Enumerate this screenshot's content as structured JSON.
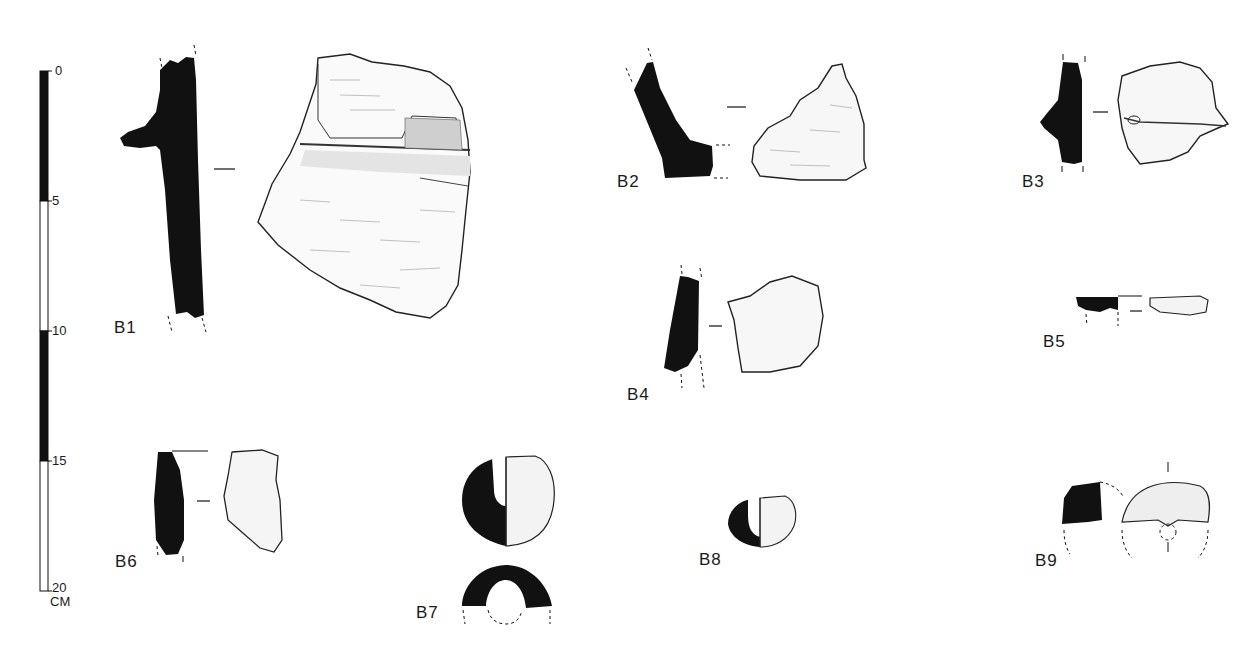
{
  "figure": {
    "type": "archaeological pottery sherd drawings",
    "background": "#ffffff",
    "ink_color": "#111111"
  },
  "scale_bar": {
    "ticks": [
      "0",
      "5",
      "10",
      "15",
      "20"
    ],
    "unit": "CM",
    "segments": [
      {
        "from": 0,
        "to": 5,
        "fill": "black"
      },
      {
        "from": 5,
        "to": 10,
        "fill": "white"
      },
      {
        "from": 10,
        "to": 15,
        "fill": "black"
      },
      {
        "from": 15,
        "to": 20,
        "fill": "white"
      }
    ]
  },
  "sherds": [
    {
      "id": "B1",
      "label": "B1",
      "description": "Rim sherd profile with applied ridge and exterior view"
    },
    {
      "id": "B2",
      "label": "B2",
      "description": "Angled rim profile with lumpy exterior view"
    },
    {
      "id": "B3",
      "label": "B3",
      "description": "Body sherd with ridge profile and exterior view"
    },
    {
      "id": "B4",
      "label": "B4",
      "description": "Body sherd profile and exterior view"
    },
    {
      "id": "B5",
      "label": "B5",
      "description": "Small flat rim profile and view"
    },
    {
      "id": "B6",
      "label": "B6",
      "description": "Rim sherd profile and exterior view"
    },
    {
      "id": "B7",
      "label": "B7",
      "description": "Handle section, half-section and cross-section"
    },
    {
      "id": "B8",
      "label": "B8",
      "description": "Small handle half-section"
    },
    {
      "id": "B9",
      "label": "B9",
      "description": "Lug fragment profile and reconstructed view"
    }
  ]
}
